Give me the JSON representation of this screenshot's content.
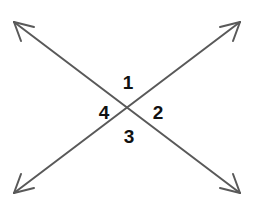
{
  "figure": {
    "width": 260,
    "height": 205,
    "background_color": "#ffffff",
    "line_color": "#595959",
    "line_width": 2,
    "label_color": "#111111",
    "label_font_size": 19,
    "intersection": {
      "x": 130,
      "y": 109
    },
    "lines": [
      {
        "name": "line-descending",
        "x1": 14,
        "y1": 22,
        "x2": 240,
        "y2": 193,
        "arrow_start": true,
        "arrow_end": true
      },
      {
        "name": "line-ascending",
        "x1": 14,
        "y1": 193,
        "x2": 240,
        "y2": 22,
        "arrow_start": true,
        "arrow_end": true
      }
    ],
    "arrowheads": [
      {
        "name": "arrowhead-top-left",
        "x": 14,
        "y": 22
      },
      {
        "name": "arrowhead-top-right",
        "x": 240,
        "y": 22
      },
      {
        "name": "arrowhead-bottom-left",
        "x": 14,
        "y": 193
      },
      {
        "name": "arrowhead-bottom-right",
        "x": 240,
        "y": 193
      }
    ],
    "labels": [
      {
        "id": "1",
        "text": "1",
        "position": "top",
        "x": 128,
        "y": 82
      },
      {
        "id": "2",
        "text": "2",
        "position": "right",
        "x": 158,
        "y": 112
      },
      {
        "id": "3",
        "text": "3",
        "position": "bottom",
        "x": 129,
        "y": 136
      },
      {
        "id": "4",
        "text": "4",
        "position": "left",
        "x": 104,
        "y": 112
      }
    ]
  }
}
